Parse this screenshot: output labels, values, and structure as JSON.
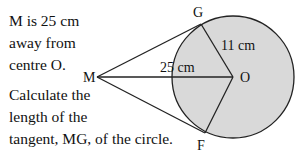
{
  "problem": {
    "given_lines": [
      "M is 25 cm",
      "away from",
      "centre O."
    ],
    "question_lines": [
      "Calculate the",
      "length of the",
      "tangent, MG, of the circle."
    ]
  },
  "diagram": {
    "points": {
      "M": "M",
      "O": "O",
      "G": "G",
      "F": "F"
    },
    "measurements": {
      "MO": "25 cm",
      "OG": "11 cm"
    },
    "circle_fill": "#d9d9d9",
    "stroke": "#222222"
  }
}
